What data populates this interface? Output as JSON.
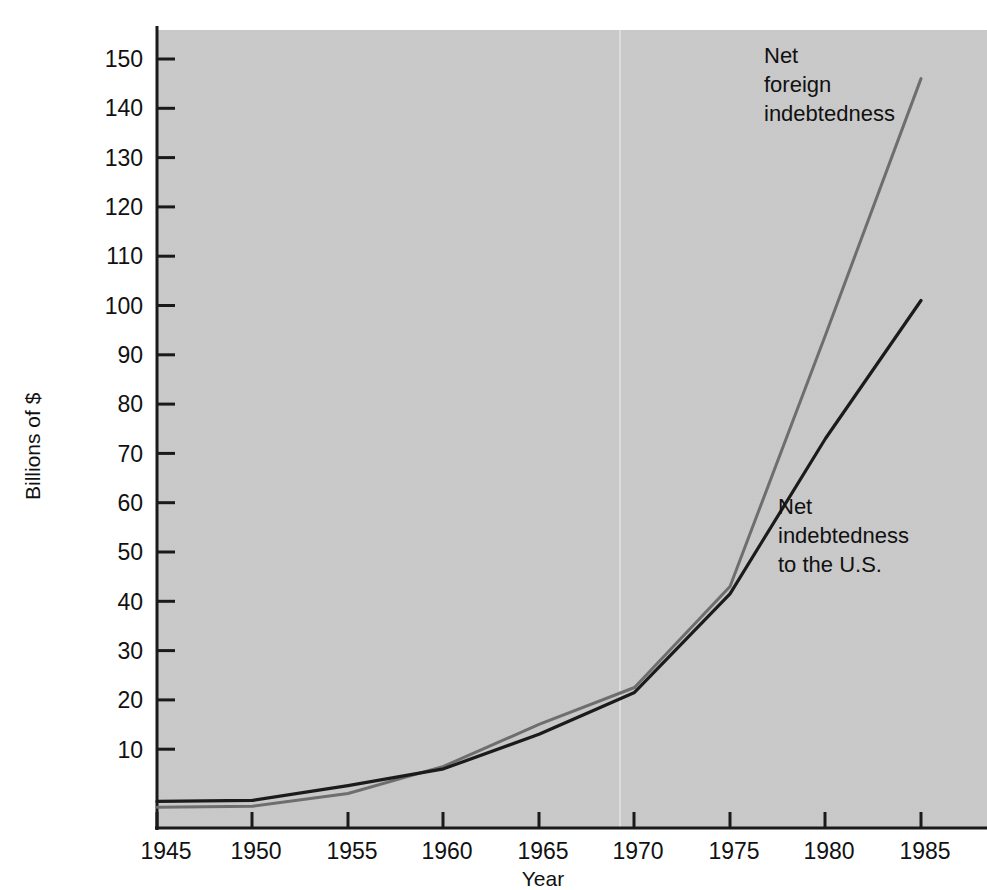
{
  "chart_data": {
    "type": "line",
    "title": "",
    "xlabel": "Year",
    "ylabel": "Billions of $",
    "xlim": [
      1945,
      1985
    ],
    "ylim": [
      0,
      158
    ],
    "xticks": [
      1945,
      1950,
      1955,
      1960,
      1965,
      1970,
      1975,
      1980,
      1985
    ],
    "xtick_labels": [
      "1945",
      "1950",
      "1955",
      "1960",
      "1965",
      "1970",
      "1975",
      "1980",
      "1985"
    ],
    "yticks": [
      10,
      20,
      30,
      40,
      50,
      60,
      70,
      80,
      90,
      100,
      110,
      120,
      130,
      140,
      150
    ],
    "ytick_labels": [
      "10",
      "20",
      "30",
      "40",
      "50",
      "60",
      "70",
      "80",
      "90",
      "100",
      "110",
      "120",
      "130",
      "140",
      "150"
    ],
    "grid": false,
    "legend_position": "inline-annotations",
    "x": [
      1945,
      1950,
      1955,
      1960,
      1965,
      1970,
      1975,
      1980,
      1985
    ],
    "series": [
      {
        "name": "Net foreign indebtedness",
        "color": "#6e6e6e",
        "values": [
          4.2,
          4.4,
          7.0,
          12.5,
          21.0,
          28.5,
          49.0,
          100.0,
          152.0
        ]
      },
      {
        "name": "Net indebtedness to the U.S.",
        "color": "#1b1b1b",
        "values": [
          5.4,
          5.6,
          8.6,
          12.0,
          19.0,
          27.5,
          47.5,
          79.0,
          107.0
        ]
      }
    ],
    "annotations": [
      {
        "id": "annotation-net-foreign-indebtedness",
        "lines": [
          "Net",
          "foreign",
          "indebtedness"
        ],
        "x": 1985,
        "y": 152
      },
      {
        "id": "annotation-net-indebtedness-to-us",
        "lines": [
          "Net",
          "indebtedness",
          "to the U.S."
        ],
        "x": 1980,
        "y": 79
      }
    ],
    "colors": {
      "plot_background": "#c9c9c9",
      "page_background": "#ffffff",
      "axis": "#1a1a1a",
      "series_foreign": "#6e6e6e",
      "series_us": "#1b1b1b",
      "text": "#111111"
    }
  }
}
